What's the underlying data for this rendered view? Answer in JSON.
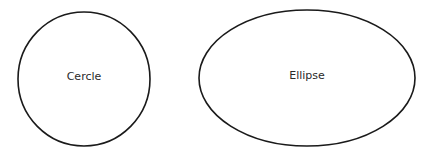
{
  "shapes": [
    {
      "type": "circle",
      "label": "Cercle",
      "cx": 84,
      "cy": 79,
      "rx": 66,
      "ry": 67
    },
    {
      "type": "ellipse",
      "label": "Ellipse",
      "cx": 307,
      "cy": 78,
      "rx": 108,
      "ry": 68
    }
  ],
  "colors": {
    "stroke": "#1a1a1a",
    "background": "#ffffff"
  }
}
